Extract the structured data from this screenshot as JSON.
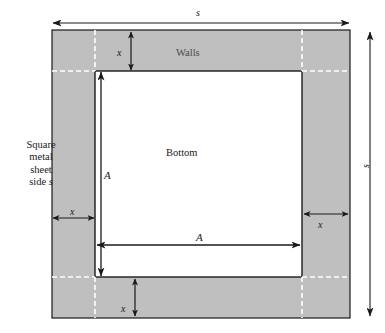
{
  "diagram": {
    "title_concept": "Square metal sheet box construction",
    "labels": {
      "sheet": "Square\nmetal\nsheet\nside s",
      "sheet_line1": "Square",
      "sheet_line2": "metal",
      "sheet_line3": "sheet",
      "sheet_line4": "side",
      "sheet_var": "s",
      "walls": "Walls",
      "bottom": "Bottom",
      "s_top": "s",
      "s_right": "s",
      "A_vertical": "A",
      "A_horizontal": "A",
      "x_top": "x",
      "x_left": "x",
      "x_right": "x",
      "x_bottom": "x"
    },
    "colors": {
      "wall_fill": "#bfbfbf",
      "bottom_fill": "#ffffff",
      "outline": "#1a1a1a",
      "dashed_guide": "#ffffff",
      "page_background": "#ffffff",
      "walls_text": "#4a4a4a"
    },
    "geometry": {
      "sheet_left": 52,
      "sheet_top": 30,
      "sheet_right": 350,
      "sheet_bottom": 318,
      "bottom_left": 95,
      "bottom_top": 71,
      "bottom_right": 302,
      "bottom_bottom": 277,
      "wall_width_x": 43,
      "sheet_side_s": 298,
      "bottom_side_A": 207
    },
    "relations": {
      "side_relation": "A = s - 2x"
    }
  }
}
